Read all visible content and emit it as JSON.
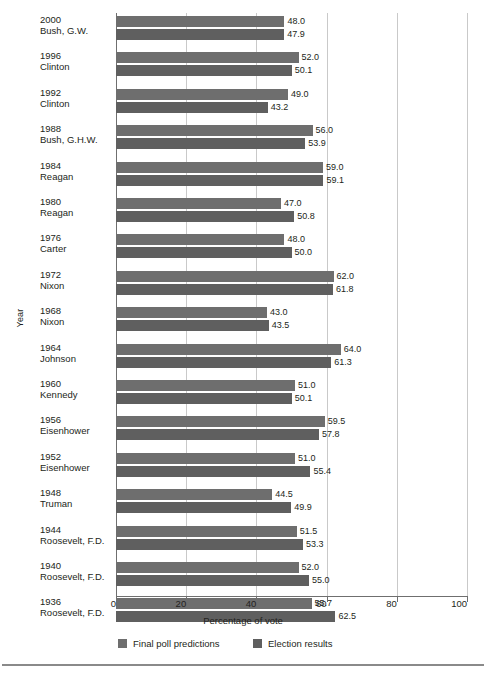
{
  "chart_data": {
    "type": "bar",
    "orientation": "horizontal",
    "title": "",
    "xlabel": "Percentage of vote",
    "ylabel": "Year",
    "xlim": [
      0,
      100
    ],
    "xticks": [
      0,
      20,
      40,
      60,
      80,
      100
    ],
    "xtick_labels": [
      "0",
      "20",
      "40",
      "60",
      "80",
      "100"
    ],
    "grid": true,
    "grid_axis": "x",
    "legend_position": "bottom",
    "categories": [
      "2000 Bush, G.W.",
      "1996 Clinton",
      "1992 Clinton",
      "1988 Bush, G.H.W.",
      "1984 Reagan",
      "1980 Reagan",
      "1976 Carter",
      "1972 Nixon",
      "1968 Nixon",
      "1964 Johnson",
      "1960 Kennedy",
      "1956 Eisenhower",
      "1952 Eisenhower",
      "1948 Truman",
      "1944 Roosevelt, F.D.",
      "1940 Roosevelt, F.D.",
      "1936 Roosevelt, F.D."
    ],
    "series": [
      {
        "name": "Final poll predictions",
        "color": "#6e6e6e",
        "values": [
          48.0,
          52.0,
          49.0,
          56.0,
          59.0,
          47.0,
          48.0,
          62.0,
          43.0,
          64.0,
          51.0,
          59.5,
          51.0,
          44.5,
          51.5,
          52.0,
          55.7
        ]
      },
      {
        "name": "Election results",
        "color": "#5f5f5f",
        "values": [
          47.9,
          50.1,
          43.2,
          53.9,
          59.1,
          50.8,
          50.0,
          61.8,
          43.5,
          61.3,
          50.1,
          57.8,
          55.4,
          49.9,
          53.3,
          55.0,
          62.5
        ]
      }
    ]
  },
  "rows": [
    {
      "year": "2000",
      "name": "Bush, G.W.",
      "pred": 48.0,
      "res": 47.9,
      "pred_label": "48.0",
      "res_label": "47.9"
    },
    {
      "year": "1996",
      "name": "Clinton",
      "pred": 52.0,
      "res": 50.1,
      "pred_label": "52.0",
      "res_label": "50.1"
    },
    {
      "year": "1992",
      "name": "Clinton",
      "pred": 49.0,
      "res": 43.2,
      "pred_label": "49.0",
      "res_label": "43.2"
    },
    {
      "year": "1988",
      "name": "Bush, G.H.W.",
      "pred": 56.0,
      "res": 53.9,
      "pred_label": "56.0",
      "res_label": "53.9"
    },
    {
      "year": "1984",
      "name": "Reagan",
      "pred": 59.0,
      "res": 59.1,
      "pred_label": "59.0",
      "res_label": "59.1"
    },
    {
      "year": "1980",
      "name": "Reagan",
      "pred": 47.0,
      "res": 50.8,
      "pred_label": "47.0",
      "res_label": "50.8"
    },
    {
      "year": "1976",
      "name": "Carter",
      "pred": 48.0,
      "res": 50.0,
      "pred_label": "48.0",
      "res_label": "50.0"
    },
    {
      "year": "1972",
      "name": "Nixon",
      "pred": 62.0,
      "res": 61.8,
      "pred_label": "62.0",
      "res_label": "61.8"
    },
    {
      "year": "1968",
      "name": "Nixon",
      "pred": 43.0,
      "res": 43.5,
      "pred_label": "43.0",
      "res_label": "43.5"
    },
    {
      "year": "1964",
      "name": "Johnson",
      "pred": 64.0,
      "res": 61.3,
      "pred_label": "64.0",
      "res_label": "61.3"
    },
    {
      "year": "1960",
      "name": "Kennedy",
      "pred": 51.0,
      "res": 50.1,
      "pred_label": "51.0",
      "res_label": "50.1"
    },
    {
      "year": "1956",
      "name": "Eisenhower",
      "pred": 59.5,
      "res": 57.8,
      "pred_label": "59.5",
      "res_label": "57.8"
    },
    {
      "year": "1952",
      "name": "Eisenhower",
      "pred": 51.0,
      "res": 55.4,
      "pred_label": "51.0",
      "res_label": "55.4"
    },
    {
      "year": "1948",
      "name": "Truman",
      "pred": 44.5,
      "res": 49.9,
      "pred_label": "44.5",
      "res_label": "49.9"
    },
    {
      "year": "1944",
      "name": "Roosevelt, F.D.",
      "pred": 51.5,
      "res": 53.3,
      "pred_label": "51.5",
      "res_label": "53.3"
    },
    {
      "year": "1940",
      "name": "Roosevelt, F.D.",
      "pred": 52.0,
      "res": 55.0,
      "pred_label": "52.0",
      "res_label": "55.0"
    },
    {
      "year": "1936",
      "name": "Roosevelt, F.D.",
      "pred": 55.7,
      "res": 62.5,
      "pred_label": "55.7",
      "res_label": "62.5"
    }
  ],
  "axis": {
    "ylabel": "Year",
    "xlabel": "Percentage of vote",
    "xticks": [
      "0",
      "20",
      "40",
      "60",
      "80",
      "100"
    ]
  },
  "legend": [
    {
      "label": "Final poll predictions",
      "color": "#6e6e6e"
    },
    {
      "label": "Election results",
      "color": "#5f5f5f"
    }
  ]
}
